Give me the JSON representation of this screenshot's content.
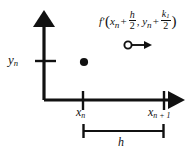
{
  "diagram": {
    "background_color": "#ffffff",
    "ink_color": "#111111",
    "axes": {
      "y_axis_label": "y",
      "y_axis_label_sub": "n",
      "x_axis_label_left": "x",
      "x_axis_label_left_sub": "n",
      "x_axis_label_right": "x",
      "x_axis_label_right_sub": "n + 1",
      "origin_x": 44,
      "origin_y": 100
    },
    "ticks": {
      "y_tick_value": "y_n",
      "x_tick_left_value": "x_n",
      "x_tick_right_value": "x_n+1"
    },
    "interval": {
      "bracket_label": "h",
      "bracket_left_x": 83,
      "bracket_right_x": 164
    },
    "point": {
      "style": "filled-dot",
      "x": 84,
      "y": 62
    },
    "slope_marker": {
      "style": "open-circle-with-right-arrow",
      "circle_x": 128,
      "circle_y": 45
    },
    "formula": {
      "function": "f",
      "prime": "′",
      "open_paren": "(",
      "arg1_base": "x",
      "arg1_sub": "n",
      "plus1": "+",
      "frac1_num": "h",
      "frac1_den": "2",
      "comma": ",",
      "arg2_base": "y",
      "arg2_sub": "n",
      "plus2": "+",
      "frac2_num": "k",
      "frac2_num_sub": "1",
      "frac2_den": "2",
      "close_paren": ")"
    }
  }
}
